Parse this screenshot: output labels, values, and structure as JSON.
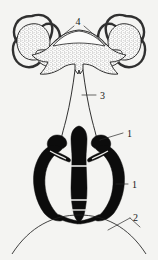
{
  "figure": {
    "background_color": "#f4f4f2",
    "ink_color": "#161616",
    "style": "stippled-and-solid-black scientific illustration"
  },
  "labels": [
    {
      "id": "label-4",
      "text": "4",
      "x": 78,
      "y": 22,
      "leader": "two diagonal lines forming a V toward the central arch"
    },
    {
      "id": "label-3",
      "text": "3",
      "x": 100,
      "y": 96,
      "leader": "horizontal line to the left toward the vertical stalk"
    },
    {
      "id": "label-1-upper",
      "text": "1",
      "x": 127,
      "y": 134,
      "leader": "short diagonal line down-left to the lateral arm apex"
    },
    {
      "id": "label-1-lower",
      "text": "1",
      "x": 132,
      "y": 185,
      "leader": "short horizontal line left to the outer lateral arm"
    },
    {
      "id": "label-2",
      "text": "2",
      "x": 133,
      "y": 218,
      "leader": "diagonal line down-left meeting the basal arc"
    }
  ],
  "structures": [
    {
      "name": "left-lobe-rings",
      "description": "left paired ring-shaped lobes with hatched borders"
    },
    {
      "name": "right-lobe-rings",
      "description": "right paired ring-shaped lobes with hatched borders"
    },
    {
      "name": "central-stippled-body",
      "description": "central arched transverse body with dense stippling"
    },
    {
      "name": "median-stalk",
      "description": "narrow vertical stalk descending from the central body"
    },
    {
      "name": "solid-black-apparatus",
      "description": "lower solid black bilateral apparatus with central column"
    },
    {
      "name": "basal-arc",
      "description": "wide shallow arc across the bottom of the figure"
    }
  ]
}
